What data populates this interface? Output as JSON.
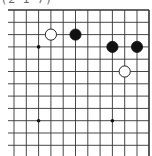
{
  "caption": "(2 1 7)",
  "board": {
    "grid": {
      "x_lines": [
        14,
        26.3,
        38.6,
        50.9,
        63.2,
        75.5,
        87.8,
        100.1,
        112.4,
        124.7,
        137,
        149
      ],
      "y_lines": [
        10,
        22.3,
        34.6,
        46.9,
        59.2,
        71.5,
        83.8,
        96.1,
        108.4,
        120.7,
        133,
        145.3
      ],
      "top_edge": true,
      "right_edge": true,
      "line_color": "#333333"
    },
    "star_points": [
      {
        "col": 2,
        "row": 3
      },
      {
        "col": 2,
        "row": 9
      },
      {
        "col": 8,
        "row": 9
      }
    ],
    "stones": [
      {
        "color": "white",
        "col": 3,
        "row": 2
      },
      {
        "color": "black",
        "col": 5,
        "row": 2
      },
      {
        "color": "black",
        "col": 8,
        "row": 3
      },
      {
        "color": "black",
        "col": 10,
        "row": 3
      },
      {
        "color": "white",
        "col": 9,
        "row": 5
      }
    ]
  }
}
